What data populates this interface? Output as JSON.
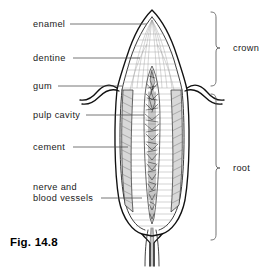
{
  "figure": {
    "caption": "Fig. 14.8",
    "background_color": "#ffffff",
    "ink_color": "#111111",
    "leader_color": "#4a4a4a"
  },
  "labels": [
    {
      "id": "enamel",
      "text": "enamel",
      "text_x": 33,
      "text_y": 27,
      "leader_x1": 70,
      "leader_y1": 24,
      "leader_x2": 147,
      "leader_y2": 24
    },
    {
      "id": "dentine",
      "text": "dentine",
      "text_x": 33,
      "text_y": 61,
      "leader_x1": 73,
      "leader_y1": 58,
      "leader_x2": 140,
      "leader_y2": 58
    },
    {
      "id": "gum",
      "text": "gum",
      "text_x": 33,
      "text_y": 89,
      "leader_x1": 58,
      "leader_y1": 86,
      "leader_x2": 122,
      "leader_y2": 86
    },
    {
      "id": "pulp-cavity",
      "text": "pulp cavity",
      "text_x": 33,
      "text_y": 118,
      "leader_x1": 86,
      "leader_y1": 115,
      "leader_x2": 144,
      "leader_y2": 115
    },
    {
      "id": "cement",
      "text": "cement",
      "text_x": 33,
      "text_y": 150,
      "leader_x1": 73,
      "leader_y1": 147,
      "leader_x2": 128,
      "leader_y2": 147
    },
    {
      "id": "nerve-vessels",
      "text_line1": "nerve and",
      "text_line2": "blood vessels",
      "text_x": 33,
      "text_y": 190,
      "text_y2": 201,
      "leader_x1": 101,
      "leader_y1": 198,
      "leader_x2": 142,
      "leader_y2": 198
    }
  ],
  "brackets": [
    {
      "id": "crown",
      "text": "crown",
      "text_x": 233,
      "text_y": 51,
      "top_y": 12,
      "bottom_y": 86,
      "spine_x": 216,
      "tick_y": 48
    },
    {
      "id": "root",
      "text": "root",
      "text_x": 233,
      "text_y": 171,
      "top_y": 94,
      "bottom_y": 240,
      "spine_x": 216,
      "tick_y": 168
    }
  ],
  "anatomy": {
    "crown_apex": {
      "x": 152,
      "y": 10
    },
    "gum_line_y": 88,
    "root_apex_y": 232,
    "tooth_center_x": 152,
    "regions": [
      "enamel",
      "dentine",
      "gum",
      "pulp cavity",
      "cement",
      "nerve and blood vessels"
    ]
  }
}
